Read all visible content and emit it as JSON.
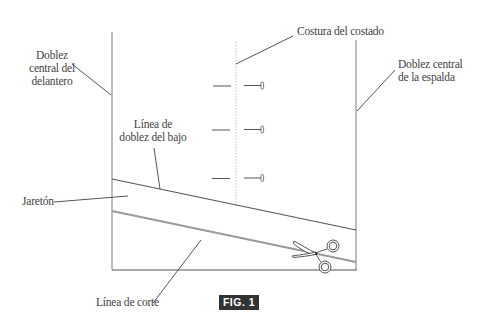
{
  "figure": {
    "caption": "FIG. 1",
    "colors": {
      "fold_line": "#bdbdbd",
      "cut_line": "#9a9a9a",
      "hem_fold_line": "#555555",
      "leader_line": "#555555",
      "text": "#3f3f3f",
      "caption_bg": "#333333",
      "caption_text": "#ffffff"
    }
  },
  "labels": {
    "front_fold": [
      "Doblez",
      "central del",
      "delantero"
    ],
    "side_seam": "Costura del costado",
    "back_fold": [
      "Doblez central",
      "de la espalda"
    ],
    "hem_fold_line": [
      "Línea de",
      "doblez del bajo"
    ],
    "hem": "Jaretón",
    "cut_line": "Línea de corte"
  },
  "icons": {
    "pins": "pin-icon",
    "scissors": "scissors-icon"
  }
}
